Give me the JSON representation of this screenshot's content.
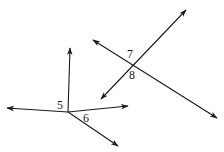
{
  "diagram": {
    "stroke_color": "#1a1a1a",
    "background": "#ffffff",
    "figures": [
      {
        "name": "rays-figure",
        "vertex": [
          68,
          112
        ],
        "rays": [
          {
            "name": "ray-up",
            "to": [
              70,
              48
            ]
          },
          {
            "name": "ray-left",
            "to": [
              7,
              108
            ]
          },
          {
            "name": "ray-right",
            "to": [
              128,
              106
            ]
          },
          {
            "name": "ray-down-right",
            "to": [
              118,
              146
            ]
          }
        ],
        "labels": [
          {
            "text": "5",
            "x": 57,
            "y": 109
          },
          {
            "text": "6",
            "x": 83,
            "y": 122
          }
        ]
      },
      {
        "name": "intersecting-lines-figure",
        "intersection": [
          133,
          64
        ],
        "lines": [
          {
            "name": "line-a",
            "from": [
              101,
              99
            ],
            "to": [
              186,
              10
            ]
          },
          {
            "name": "line-b",
            "from": [
              93,
              40
            ],
            "to": [
              217,
              118
            ]
          }
        ],
        "labels": [
          {
            "text": "7",
            "x": 127,
            "y": 58
          },
          {
            "text": "8",
            "x": 129,
            "y": 79
          }
        ]
      }
    ]
  }
}
